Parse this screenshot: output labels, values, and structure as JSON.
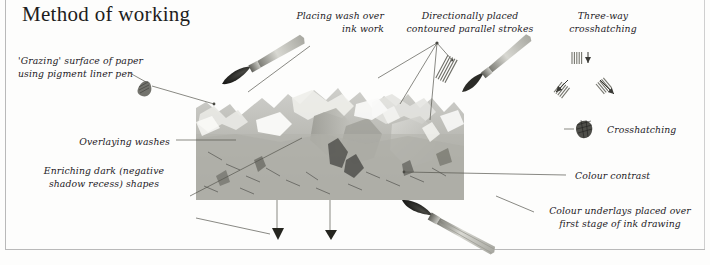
{
  "page": {
    "title": "Method of working",
    "background_color": "#fdfdfc",
    "frame_color": "#b9b9b9",
    "text_color": "#23201e"
  },
  "annotations": [
    {
      "id": "grazing-surface",
      "text": "'Grazing' surface of paper\nusing pigment liner pen",
      "align": "left",
      "x": 18,
      "y": 55
    },
    {
      "id": "placing-wash",
      "text": "Placing wash over\nink work",
      "align": "right",
      "x": 296,
      "y": 10
    },
    {
      "id": "directionally-placed",
      "text": "Directionally placed\ncontoured parallel strokes",
      "align": "center",
      "x": 402,
      "y": 10
    },
    {
      "id": "three-way-crosshatching",
      "text": "Three-way\ncrosshatching",
      "align": "center",
      "x": 572,
      "y": 10
    },
    {
      "id": "overlaying-washes",
      "text": "Overlaying washes",
      "align": "right",
      "x": 50,
      "y": 136
    },
    {
      "id": "enriching-dark",
      "text": "Enriching dark (negative\nshadow recess) shapes",
      "align": "center",
      "x": 38,
      "y": 165
    },
    {
      "id": "crosshatching",
      "text": "Crosshatching",
      "align": "left",
      "x": 607,
      "y": 124
    },
    {
      "id": "colour-contrast",
      "text": "Colour contrast",
      "align": "left",
      "x": 575,
      "y": 170
    },
    {
      "id": "colour-underlays",
      "text": "Colour underlays placed over\nfirst stage of ink drawing",
      "align": "center",
      "x": 541,
      "y": 205
    }
  ],
  "artwork": {
    "caption": "grayscale ink-and-wash study with brushes",
    "x": 196,
    "y": 68,
    "width": 268,
    "height": 132
  },
  "samples": [
    {
      "id": "hatch-swatch-vertical",
      "x": 578,
      "y": 57
    },
    {
      "id": "hatch-swatch-left",
      "x": 563,
      "y": 84
    },
    {
      "id": "hatch-swatch-right",
      "x": 600,
      "y": 86
    },
    {
      "id": "crosshatch-blob",
      "x": 578,
      "y": 122
    },
    {
      "id": "parallel-stroke-swatch",
      "x": 448,
      "y": 55
    },
    {
      "id": "graze-texture-blob",
      "x": 140,
      "y": 85
    }
  ],
  "brushes": [
    {
      "id": "brush-upper-left",
      "tip_x": 222,
      "tip_y": 84
    },
    {
      "id": "brush-upper-right",
      "tip_x": 462,
      "tip_y": 92
    },
    {
      "id": "brush-lower-right",
      "tip_x": 402,
      "tip_y": 200
    }
  ],
  "markers": [
    {
      "id": "down-arrow-left",
      "x": 277,
      "y": 236
    },
    {
      "id": "down-arrow-right",
      "x": 330,
      "y": 236
    }
  ]
}
